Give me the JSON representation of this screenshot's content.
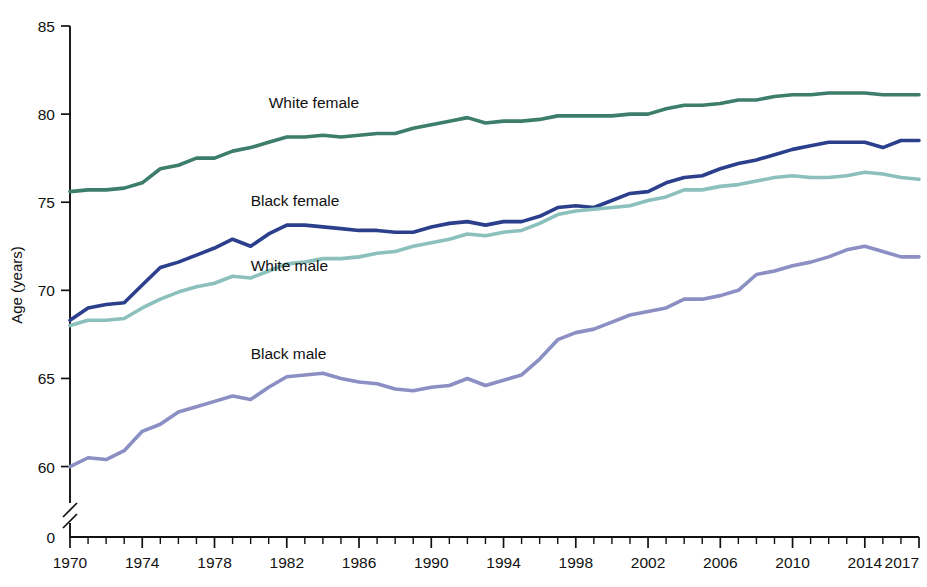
{
  "chart_data": {
    "type": "line",
    "title": "",
    "subtitle": "",
    "xlabel": "",
    "ylabel": "Age (years)",
    "xlim": [
      1970,
      2017
    ],
    "ylim": [
      58.5,
      85
    ],
    "y_axis_break": true,
    "y_break_note": "Axis broken between 0 and ~58.5",
    "grid": false,
    "legend_position": "inline-labels",
    "x_tick_labels": [
      "1970",
      "1974",
      "1978",
      "1982",
      "1986",
      "1990",
      "1994",
      "1998",
      "2002",
      "2006",
      "2010",
      "2014",
      "2017"
    ],
    "x_tick_values": [
      1970,
      1974,
      1978,
      1982,
      1986,
      1990,
      1994,
      1998,
      2002,
      2006,
      2010,
      2014,
      2017
    ],
    "x_minor_tick_interval": 1,
    "y_tick_labels": [
      "0",
      "60",
      "65",
      "70",
      "75",
      "80",
      "85"
    ],
    "y_tick_values": [
      0,
      60,
      65,
      70,
      75,
      80,
      85
    ],
    "x": [
      1970,
      1971,
      1972,
      1973,
      1974,
      1975,
      1976,
      1977,
      1978,
      1979,
      1980,
      1981,
      1982,
      1983,
      1984,
      1985,
      1986,
      1987,
      1988,
      1989,
      1990,
      1991,
      1992,
      1993,
      1994,
      1995,
      1996,
      1997,
      1998,
      1999,
      2000,
      2001,
      2002,
      2003,
      2004,
      2005,
      2006,
      2007,
      2008,
      2009,
      2010,
      2011,
      2012,
      2013,
      2014,
      2015,
      2016,
      2017
    ],
    "series": [
      {
        "name": "White female",
        "label": "White female",
        "color": "#3d7d6b",
        "label_x": 1981.0,
        "label_y": 80.35,
        "values": [
          75.6,
          75.7,
          75.7,
          75.8,
          76.1,
          76.9,
          77.1,
          77.5,
          77.5,
          77.9,
          78.1,
          78.4,
          78.7,
          78.7,
          78.8,
          78.7,
          78.8,
          78.9,
          78.9,
          79.2,
          79.4,
          79.6,
          79.8,
          79.5,
          79.6,
          79.6,
          79.7,
          79.9,
          79.9,
          79.9,
          79.9,
          80.0,
          80.0,
          80.3,
          80.5,
          80.5,
          80.6,
          80.8,
          80.8,
          81.0,
          81.1,
          81.1,
          81.2,
          81.2,
          81.2,
          81.1,
          81.1,
          81.1
        ]
      },
      {
        "name": "Black female",
        "label": "Black female",
        "color": "#2b3f8c",
        "label_x": 1980.0,
        "label_y": 74.8,
        "values": [
          68.3,
          69.0,
          69.2,
          69.3,
          70.3,
          71.3,
          71.6,
          72.0,
          72.4,
          72.9,
          72.5,
          73.2,
          73.7,
          73.7,
          73.6,
          73.5,
          73.4,
          73.4,
          73.3,
          73.3,
          73.6,
          73.8,
          73.9,
          73.7,
          73.9,
          73.9,
          74.2,
          74.7,
          74.8,
          74.7,
          75.1,
          75.5,
          75.6,
          76.1,
          76.4,
          76.5,
          76.9,
          77.2,
          77.4,
          77.7,
          78.0,
          78.2,
          78.4,
          78.4,
          78.4,
          78.1,
          78.5,
          78.5
        ]
      },
      {
        "name": "White male",
        "label": "White male",
        "color": "#8cc0bc",
        "label_x": 1980.0,
        "label_y": 71.1,
        "values": [
          68.0,
          68.3,
          68.3,
          68.4,
          69.0,
          69.5,
          69.9,
          70.2,
          70.4,
          70.8,
          70.7,
          71.1,
          71.5,
          71.6,
          71.8,
          71.8,
          71.9,
          72.1,
          72.2,
          72.5,
          72.7,
          72.9,
          73.2,
          73.1,
          73.3,
          73.4,
          73.8,
          74.3,
          74.5,
          74.6,
          74.7,
          74.8,
          75.1,
          75.3,
          75.7,
          75.7,
          75.9,
          76.0,
          76.2,
          76.4,
          76.5,
          76.4,
          76.4,
          76.5,
          76.7,
          76.6,
          76.4,
          76.3
        ]
      },
      {
        "name": "Black male",
        "label": "Black male",
        "color": "#8b8fc4",
        "label_x": 1980.0,
        "label_y": 66.1,
        "values": [
          60.0,
          60.5,
          60.4,
          60.9,
          62.0,
          62.4,
          63.1,
          63.4,
          63.7,
          64.0,
          63.8,
          64.5,
          65.1,
          65.2,
          65.3,
          65.0,
          64.8,
          64.7,
          64.4,
          64.3,
          64.5,
          64.6,
          65.0,
          64.6,
          64.9,
          65.2,
          66.1,
          67.2,
          67.6,
          67.8,
          68.2,
          68.6,
          68.8,
          69.0,
          69.5,
          69.5,
          69.7,
          70.0,
          70.9,
          71.1,
          71.4,
          71.6,
          71.9,
          72.3,
          72.5,
          72.2,
          71.9,
          71.9
        ]
      }
    ]
  }
}
